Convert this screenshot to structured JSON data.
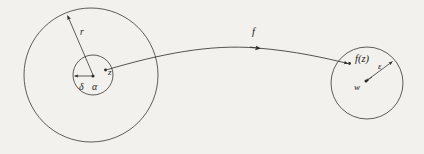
{
  "figure": {
    "background_color": "#f3f1ee",
    "stroke_color": "#2b2b2b",
    "label_color": "#1a1a1a"
  },
  "domain_side": {
    "outer_circle": {
      "name": "r-disk",
      "cx": 91,
      "cy": 75,
      "r": 67,
      "radius_label": "r"
    },
    "inner_circle": {
      "name": "delta-disk",
      "cx": 93,
      "cy": 75,
      "r": 20,
      "radius_label": "δ"
    },
    "center_point_label": "α",
    "sample_point_label": "z"
  },
  "mapping": {
    "arrow_label": "f"
  },
  "codomain_side": {
    "circle": {
      "name": "epsilon-disk",
      "cx": 367,
      "cy": 83,
      "r": 36,
      "radius_label": "ε"
    },
    "center_point_label": "w",
    "image_point_label": "f(z)"
  }
}
